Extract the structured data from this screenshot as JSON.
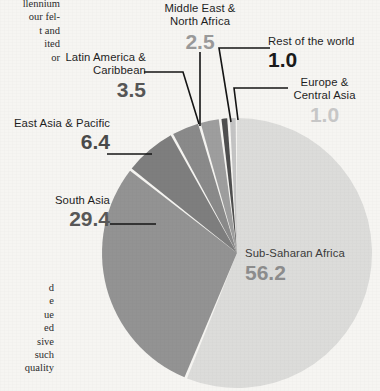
{
  "page": {
    "background_color": "#f6f5f2",
    "body_text_top_lines": [
      "llennium",
      "our fel-",
      "t and",
      "ited",
      "or"
    ],
    "body_text_bottom_lines": [
      "d",
      "e",
      "ue",
      "ed",
      "sive",
      "such",
      "quality"
    ]
  },
  "chart_data": {
    "type": "pie",
    "title": "",
    "subtitle": "",
    "xlabel": "",
    "ylabel": "",
    "legend_position": "callout-labels",
    "grid": false,
    "units": "percent",
    "categories": [
      "Sub-Saharan Africa",
      "South Asia",
      "East Asia & Pacific",
      "Latin America & Caribbean",
      "Middle East & North Africa",
      "Rest of the world",
      "Europe & Central Asia"
    ],
    "values": [
      56.2,
      29.4,
      6.4,
      3.5,
      2.5,
      1.0,
      1.0
    ],
    "slices": [
      {
        "label": "Sub-Saharan Africa",
        "label_line1": "Sub-Saharan Africa",
        "value": 56.2,
        "value_text": "56.2",
        "color": "#dcdcda",
        "value_color": "#8d8d8d",
        "label_placement": "inside"
      },
      {
        "label": "South Asia",
        "label_line1": "South Asia",
        "value": 29.4,
        "value_text": "29.4",
        "color": "#939393",
        "value_color": "#585858",
        "label_placement": "left"
      },
      {
        "label": "East Asia & Pacific",
        "label_line1": "East Asia & Pacific",
        "value": 6.4,
        "value_text": "6.4",
        "color": "#7e7e7e",
        "value_color": "#4a4a4a",
        "label_placement": "left"
      },
      {
        "label": "Latin America & Caribbean",
        "label_line1": "Latin America &",
        "label_line2": "Caribbean",
        "value": 3.5,
        "value_text": "3.5",
        "color": "#8a8a8a",
        "value_color": "#565656",
        "label_placement": "upper-left"
      },
      {
        "label": "Middle East & North Africa",
        "label_line1": "Middle East &",
        "label_line2": "North Africa",
        "value": 2.5,
        "value_text": "2.5",
        "color": "#9e9e9e",
        "value_color": "#9a9a9a",
        "label_placement": "top"
      },
      {
        "label": "Rest of the world",
        "label_line1": "Rest of the world",
        "value": 1.0,
        "value_text": "1.0",
        "color": "#4f4f4f",
        "value_color": "#1a1a1a",
        "label_placement": "upper-right"
      },
      {
        "label": "Europe & Central Asia",
        "label_line1": "Europe &",
        "label_line2": "Central Asia",
        "value": 1.0,
        "value_text": "1.0",
        "color": "#c4c4c4",
        "value_color": "#c8c8c8",
        "label_placement": "right"
      }
    ],
    "total": 100.0,
    "start_angle_deg": 0,
    "direction": "clockwise",
    "separator_color": "#ffffff"
  }
}
